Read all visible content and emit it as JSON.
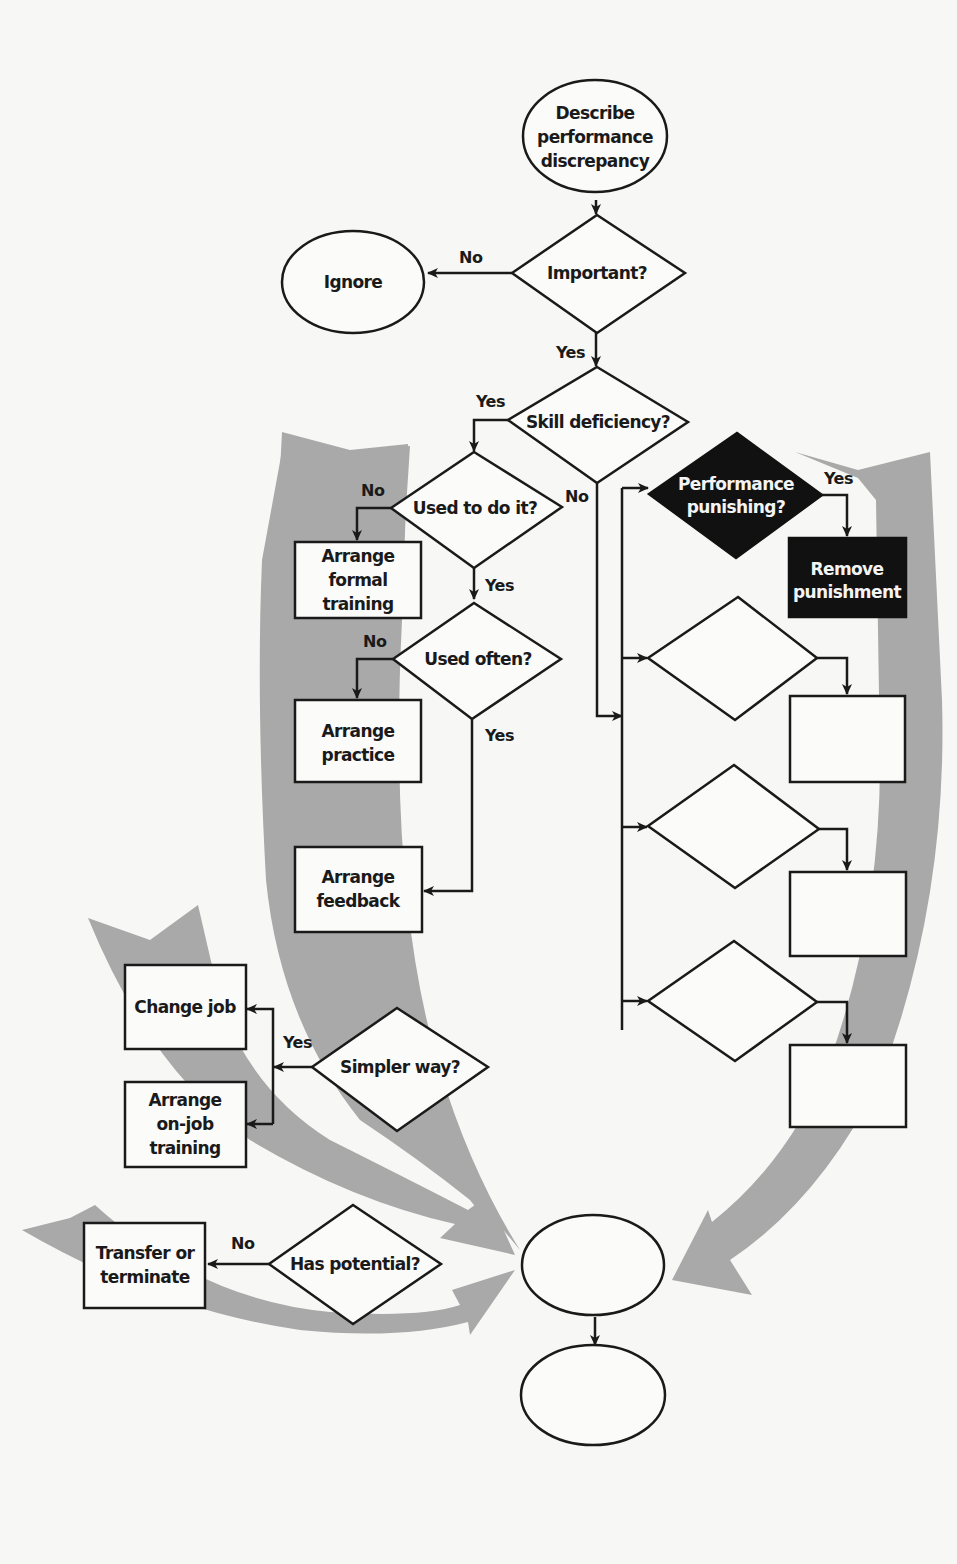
{
  "diagram": {
    "type": "flowchart",
    "background": "#f7f7f5",
    "band_color": "#a9a9a9",
    "dark_node_color": "#111111",
    "nodes": {
      "start": {
        "shape": "ellipse",
        "lines": [
          "Describe",
          "performance",
          "discrepancy"
        ]
      },
      "ignore": {
        "shape": "ellipse",
        "lines": [
          "Ignore"
        ]
      },
      "important": {
        "shape": "diamond",
        "lines": [
          "Important?"
        ]
      },
      "skill": {
        "shape": "diamond",
        "lines": [
          "Skill deficiency?"
        ]
      },
      "used_to": {
        "shape": "diamond",
        "lines": [
          "Used to do it?"
        ]
      },
      "formal_training": {
        "shape": "rect",
        "lines": [
          "Arrange",
          "formal",
          "training"
        ]
      },
      "used_often": {
        "shape": "diamond",
        "lines": [
          "Used often?"
        ]
      },
      "practice": {
        "shape": "rect",
        "lines": [
          "Arrange",
          "practice"
        ]
      },
      "feedback": {
        "shape": "rect",
        "lines": [
          "Arrange",
          "feedback"
        ]
      },
      "simpler": {
        "shape": "diamond",
        "lines": [
          "Simpler way?"
        ]
      },
      "change_job": {
        "shape": "rect",
        "lines": [
          "Change job"
        ]
      },
      "onjob": {
        "shape": "rect",
        "lines": [
          "Arrange",
          "on-job",
          "training"
        ]
      },
      "potential": {
        "shape": "diamond",
        "lines": [
          "Has potential?"
        ]
      },
      "transfer": {
        "shape": "rect",
        "lines": [
          "Transfer or",
          "terminate"
        ]
      },
      "punishing": {
        "shape": "diamond",
        "style": "dark",
        "lines": [
          "Performance",
          "punishing?"
        ]
      },
      "remove_punishment": {
        "shape": "rect",
        "style": "dark",
        "lines": [
          "Remove",
          "punishment"
        ]
      },
      "blank_diamond_1": {
        "shape": "diamond",
        "lines": []
      },
      "blank_rect_1": {
        "shape": "rect",
        "lines": []
      },
      "blank_diamond_2": {
        "shape": "diamond",
        "lines": []
      },
      "blank_rect_2": {
        "shape": "rect",
        "lines": []
      },
      "blank_diamond_3": {
        "shape": "diamond",
        "lines": []
      },
      "blank_rect_3": {
        "shape": "rect",
        "lines": []
      },
      "blank_ellipse_1": {
        "shape": "ellipse",
        "lines": []
      },
      "blank_ellipse_2": {
        "shape": "ellipse",
        "lines": []
      }
    },
    "edge_labels": {
      "important_no": "No",
      "important_yes": "Yes",
      "skill_yes": "Yes",
      "skill_no": "No",
      "used_to_no": "No",
      "used_to_yes": "Yes",
      "used_often_no": "No",
      "used_often_yes": "Yes",
      "punishing_yes": "Yes",
      "simpler_yes": "Yes",
      "potential_no": "No"
    },
    "edges": [
      {
        "from": "start",
        "to": "important"
      },
      {
        "from": "important",
        "to": "ignore",
        "label": "No"
      },
      {
        "from": "important",
        "to": "skill",
        "label": "Yes"
      },
      {
        "from": "skill",
        "to": "used_to",
        "label": "Yes"
      },
      {
        "from": "skill",
        "to": "right_bus",
        "label": "No"
      },
      {
        "from": "used_to",
        "to": "formal_training",
        "label": "No"
      },
      {
        "from": "used_to",
        "to": "used_often",
        "label": "Yes"
      },
      {
        "from": "used_often",
        "to": "practice",
        "label": "No"
      },
      {
        "from": "used_often",
        "to": "feedback",
        "label": "Yes"
      },
      {
        "from": "right_bus",
        "to": "punishing"
      },
      {
        "from": "right_bus",
        "to": "blank_diamond_1"
      },
      {
        "from": "right_bus",
        "to": "blank_diamond_2"
      },
      {
        "from": "right_bus",
        "to": "blank_diamond_3"
      },
      {
        "from": "punishing",
        "to": "remove_punishment",
        "label": "Yes"
      },
      {
        "from": "blank_diamond_1",
        "to": "blank_rect_1"
      },
      {
        "from": "blank_diamond_2",
        "to": "blank_rect_2"
      },
      {
        "from": "blank_diamond_3",
        "to": "blank_rect_3"
      },
      {
        "from": "simpler",
        "to": "change_job",
        "label": "Yes"
      },
      {
        "from": "simpler",
        "to": "onjob",
        "label": "Yes"
      },
      {
        "from": "potential",
        "to": "transfer",
        "label": "No"
      },
      {
        "from": "blank_ellipse_1",
        "to": "blank_ellipse_2"
      }
    ]
  }
}
